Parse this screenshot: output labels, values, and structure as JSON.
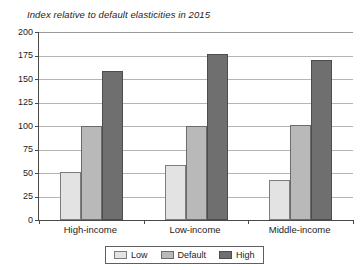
{
  "chart_data": {
    "type": "bar",
    "title": "Index relative to default elasticities in 2015",
    "xlabel": "",
    "ylabel": "",
    "ylim": [
      0,
      200
    ],
    "ytick_step": 25,
    "yticks": [
      200,
      175,
      150,
      125,
      100,
      75,
      50,
      25,
      0
    ],
    "grid": true,
    "legend_position": "bottom",
    "categories": [
      "High-income",
      "Low-income",
      "Middle-income"
    ],
    "series": [
      {
        "name": "Low",
        "color": "#e3e3e3",
        "values": [
          51,
          58,
          43
        ]
      },
      {
        "name": "Default",
        "color": "#b9b9b9",
        "values": [
          100,
          100,
          101
        ]
      },
      {
        "name": "High",
        "color": "#6f6f6f",
        "values": [
          159,
          177,
          170
        ]
      }
    ]
  },
  "legend": {
    "items": [
      {
        "label": "Low"
      },
      {
        "label": "Default"
      },
      {
        "label": "High"
      }
    ]
  }
}
